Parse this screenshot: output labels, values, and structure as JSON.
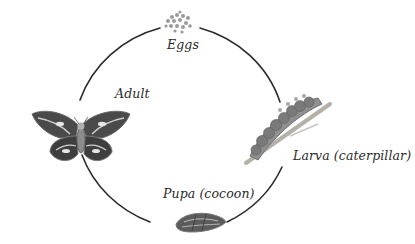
{
  "diagram": {
    "type": "life-cycle",
    "stages": [
      {
        "id": "eggs",
        "label": "Eggs"
      },
      {
        "id": "larva",
        "label": "Larva (caterpillar)"
      },
      {
        "id": "pupa",
        "label": "Pupa (cocoon)"
      },
      {
        "id": "adult",
        "label": "Adult"
      }
    ],
    "cycle_order": [
      "eggs",
      "larva",
      "pupa",
      "adult",
      "eggs"
    ],
    "colors": {
      "arc": "#2b2b2b",
      "label": "#2a2a2a",
      "illustration_dark": "#3a3a3a",
      "illustration_mid": "#8a8a8a",
      "illustration_light": "#c8c8c8",
      "branch": "#b5b0a8"
    }
  }
}
